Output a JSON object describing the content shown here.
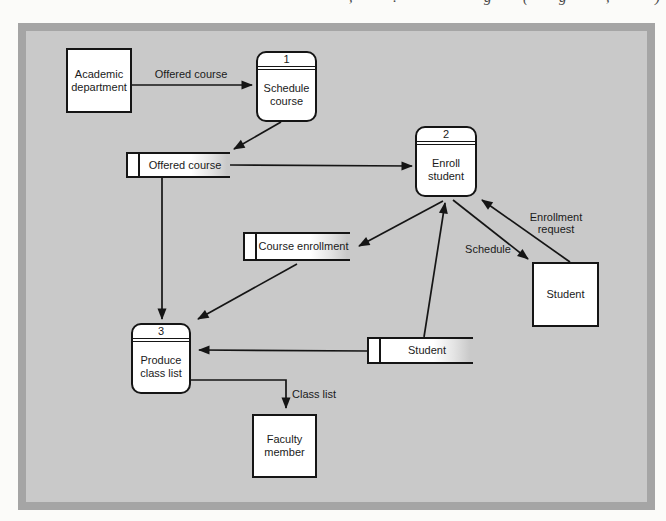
{
  "page": {
    "top_fragment_marks": [
      ",",
      ".",
      "g",
      "(",
      "g",
      ",",
      ")"
    ]
  },
  "diagram": {
    "colors": {
      "canvas": "#c9c9c9",
      "frame": "#a5a5a5",
      "node_fill": "#ffffff",
      "line": "#151515"
    },
    "processes": [
      {
        "number": "1",
        "label": "Schedule\ncourse"
      },
      {
        "number": "2",
        "label": "Enroll\nstudent"
      },
      {
        "number": "3",
        "label": "Produce\nclass list"
      }
    ],
    "external_entities": [
      {
        "label": "Academic\ndepartment"
      },
      {
        "label": "Student"
      },
      {
        "label": "Faculty\nmember"
      }
    ],
    "data_stores": [
      {
        "label": "Offered course"
      },
      {
        "label": "Course enrollment"
      },
      {
        "label": "Student"
      }
    ],
    "flow_labels": [
      {
        "label": "Offered course"
      },
      {
        "label": "Enrollment\nrequest"
      },
      {
        "label": "Schedule"
      },
      {
        "label": "Class list"
      }
    ]
  }
}
